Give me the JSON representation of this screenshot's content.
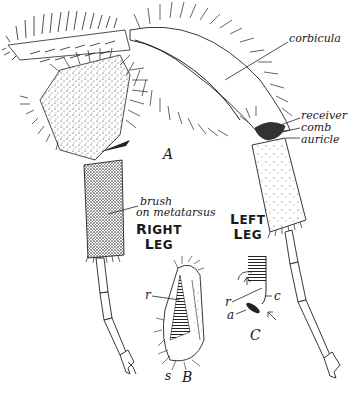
{
  "figure": {
    "panels": [
      {
        "id": "A",
        "label": "A"
      },
      {
        "id": "B",
        "label": "B"
      },
      {
        "id": "C",
        "label": "C"
      }
    ]
  },
  "labels": {
    "corbicula": "corbicula",
    "receiver": "receiver",
    "comb": "comb",
    "auricle": "auricle",
    "brush_line1": "brush",
    "brush_line2": "on metatarsus",
    "right_leg_line1_first": "R",
    "right_leg_line1_rest": "IGHT",
    "right_leg_line2_first": "L",
    "right_leg_line2_rest": "EG",
    "left_leg_line1_first": "L",
    "left_leg_line1_rest": "EFT",
    "left_leg_line2_first": "L",
    "left_leg_line2_rest": "EG"
  },
  "panel_B_labels": {
    "r": "r",
    "s": "s"
  },
  "panel_C_labels": {
    "r": "r",
    "c": "c",
    "a": "a"
  },
  "colors": {
    "ink": "#1a1a1a",
    "paper": "#ffffff"
  }
}
